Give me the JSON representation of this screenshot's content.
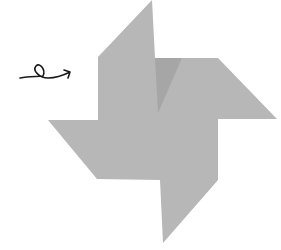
{
  "figure": {
    "colors": {
      "background": "#ffffff",
      "pinwheel": "#b7b7b7",
      "fold_shadow": "#a6a6a6",
      "arrow": "#1a1a1a"
    },
    "pinwheel_points": "152,0 155,58 218,58 277,119 218,119 218,180 163,243 160,180 97,179 48,120 98,120 98,57",
    "fold_points": "155,58 182,58 158,113",
    "arrow_path": "M20,78 C30,76 38,77 43,76 C46,70 40,62 36,66 C32,71 40,78 48,78 C56,78 64,75 70,72 M64,70 L70,72 L68,78"
  }
}
